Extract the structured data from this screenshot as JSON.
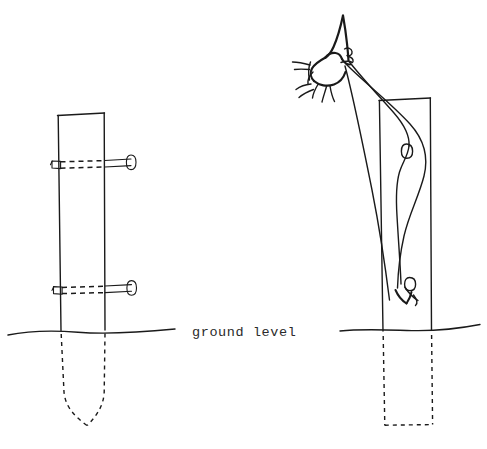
{
  "figure": {
    "background_color": "#ffffff",
    "ink_color": "#1a1a1a",
    "style": "black-and-white line drawing"
  },
  "labels": {
    "ground_level": "ground level"
  },
  "panels": [
    {
      "id": "left-panel",
      "name": "nailed-post-detail",
      "description": "Vertical post with two nails driven through it, buried end tapered to a point below ground level",
      "post": {
        "above_ground_visible": true,
        "buried_end_shape": "pointed",
        "nails_count": 2
      }
    },
    {
      "id": "right-panel",
      "name": "wire-pull-detail",
      "description": "Hand pulling a loop of wire over a post, buried end squared off below ground level",
      "post": {
        "above_ground_visible": true,
        "buried_end_shape": "flat",
        "wire_loops": 2
      }
    }
  ],
  "elements": {
    "left_post": "left-post-outline",
    "left_nail_upper": "upper-nail",
    "left_nail_lower": "lower-nail",
    "left_buried": "left-buried-post-pointed",
    "ground_line_left": "ground-line-left",
    "ground_line_right": "ground-line-right",
    "right_post": "right-post-outline",
    "right_buried": "right-buried-post-flat",
    "hand": "hand-gripping-wire",
    "wire": "wire-strands",
    "wire_loop_upper": "wire-loop-upper",
    "wire_loop_lower": "wire-loop-lower"
  }
}
